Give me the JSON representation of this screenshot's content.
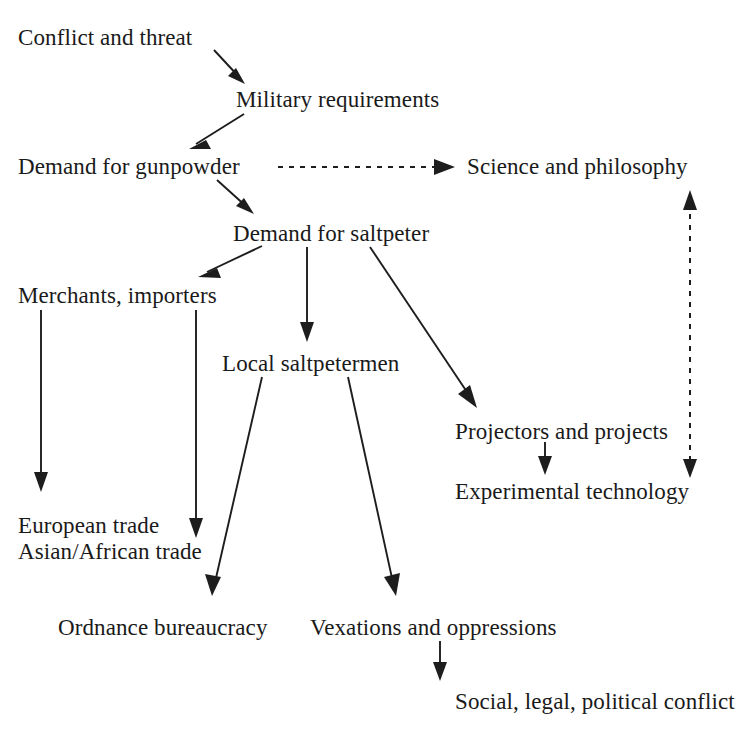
{
  "diagram": {
    "background_color": "#ffffff",
    "ink_color": "#1d1d1d",
    "nodes": [
      {
        "id": "conflict",
        "label": "Conflict and threat",
        "x": 18,
        "y": 24
      },
      {
        "id": "military",
        "label": "Military requirements",
        "x": 236,
        "y": 86
      },
      {
        "id": "gunpowder",
        "label": "Demand for gunpowder",
        "x": 18,
        "y": 153
      },
      {
        "id": "science",
        "label": "Science and philosophy",
        "x": 467,
        "y": 153
      },
      {
        "id": "saltpeter",
        "label": "Demand for saltpeter",
        "x": 233,
        "y": 220
      },
      {
        "id": "merchants",
        "label": "Merchants, importers",
        "x": 18,
        "y": 282
      },
      {
        "id": "saltpetermen",
        "label": "Local saltpetermen",
        "x": 222,
        "y": 350
      },
      {
        "id": "projectors",
        "label": "Projectors and projects",
        "x": 455,
        "y": 418
      },
      {
        "id": "exptech",
        "label": "Experimental technology",
        "x": 455,
        "y": 478
      },
      {
        "id": "trade",
        "label": "European trade",
        "label2": "Asian/African trade",
        "x": 18,
        "y": 513
      },
      {
        "id": "ordnance",
        "label": "Ordnance bureaucracy",
        "x": 58,
        "y": 614
      },
      {
        "id": "vexations",
        "label": "Vexations and oppressions",
        "x": 310,
        "y": 614
      },
      {
        "id": "social",
        "label": "Social, legal, political conflict",
        "x": 455,
        "y": 688
      }
    ],
    "edges": [
      {
        "id": "conflict-to-military",
        "from": "conflict",
        "to": "military",
        "style": "solid",
        "direction": "forward"
      },
      {
        "id": "military-to-gunpowder",
        "from": "military",
        "to": "gunpowder",
        "style": "solid",
        "direction": "forward"
      },
      {
        "id": "gunpowder-to-science",
        "from": "gunpowder",
        "to": "science",
        "style": "dashed",
        "direction": "forward"
      },
      {
        "id": "gunpowder-to-saltpeter",
        "from": "gunpowder",
        "to": "saltpeter",
        "style": "solid",
        "direction": "forward"
      },
      {
        "id": "saltpeter-to-merchants",
        "from": "saltpeter",
        "to": "merchants",
        "style": "solid",
        "direction": "forward"
      },
      {
        "id": "saltpeter-to-saltpetermen",
        "from": "saltpeter",
        "to": "saltpetermen",
        "style": "solid",
        "direction": "forward"
      },
      {
        "id": "saltpeter-to-projectors",
        "from": "saltpeter",
        "to": "projectors",
        "style": "solid",
        "direction": "forward"
      },
      {
        "id": "merchants-to-european",
        "from": "merchants",
        "to": "trade",
        "style": "solid",
        "direction": "forward"
      },
      {
        "id": "merchants-to-asian",
        "from": "merchants",
        "to": "trade",
        "style": "solid",
        "direction": "forward"
      },
      {
        "id": "saltpetermen-to-ordnance",
        "from": "saltpetermen",
        "to": "ordnance",
        "style": "solid",
        "direction": "forward"
      },
      {
        "id": "saltpetermen-to-vexations",
        "from": "saltpetermen",
        "to": "vexations",
        "style": "solid",
        "direction": "forward"
      },
      {
        "id": "projectors-to-exptech",
        "from": "projectors",
        "to": "exptech",
        "style": "solid",
        "direction": "forward"
      },
      {
        "id": "science-exptech-link",
        "from": "science",
        "to": "exptech",
        "style": "dashed",
        "direction": "both"
      },
      {
        "id": "vexations-to-social",
        "from": "vexations",
        "to": "social",
        "style": "solid",
        "direction": "forward"
      }
    ]
  }
}
